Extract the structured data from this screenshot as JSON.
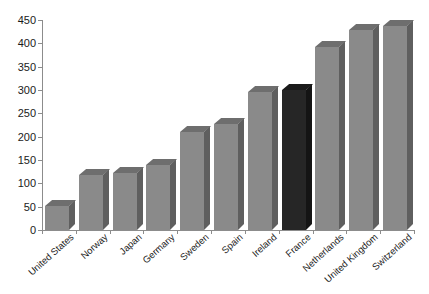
{
  "chart_data": {
    "type": "bar",
    "title": "",
    "subtitle": "",
    "xlabel": "",
    "ylabel": "",
    "ylim": [
      0,
      450
    ],
    "yticks": [
      0,
      50,
      100,
      150,
      200,
      250,
      300,
      350,
      400,
      450
    ],
    "grid": false,
    "legend": false,
    "legend_position": "none",
    "categories": [
      "United States",
      "Norway",
      "Japan",
      "Germany",
      "Sweden",
      "Spain",
      "Ireland",
      "France",
      "Netherlands",
      "United Kingdom",
      "Switzerland"
    ],
    "values": [
      52,
      118,
      122,
      140,
      210,
      228,
      296,
      300,
      392,
      428,
      437
    ],
    "bar_colors": [
      "#8a8a8a",
      "#8a8a8a",
      "#8a8a8a",
      "#8a8a8a",
      "#8a8a8a",
      "#8a8a8a",
      "#8a8a8a",
      "#262626",
      "#8a8a8a",
      "#8a8a8a",
      "#8a8a8a"
    ],
    "bar_top_colors": [
      "#6e6e6e",
      "#6e6e6e",
      "#6e6e6e",
      "#6e6e6e",
      "#6e6e6e",
      "#6e6e6e",
      "#6e6e6e",
      "#1a1a1a",
      "#6e6e6e",
      "#6e6e6e",
      "#6e6e6e"
    ],
    "bar_side_colors": [
      "#5f5f5f",
      "#5f5f5f",
      "#5f5f5f",
      "#5f5f5f",
      "#5f5f5f",
      "#5f5f5f",
      "#5f5f5f",
      "#141414",
      "#5f5f5f",
      "#5f5f5f",
      "#5f5f5f"
    ],
    "highlight_category": "France",
    "axis_color": "#8c8c8c",
    "text_color": "#1a1a1a",
    "background_color": "#ffffff"
  }
}
